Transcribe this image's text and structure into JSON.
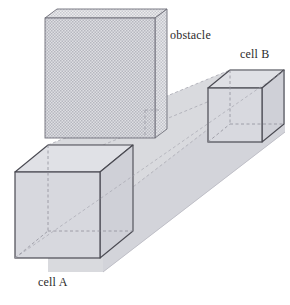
{
  "figure": {
    "type": "3d-line-diagram",
    "width": 290,
    "height": 305,
    "background_color": "#ffffff"
  },
  "labels": {
    "obstacle": "obstacle",
    "cell_b": "cell B",
    "cell_a": "cell A"
  },
  "colors": {
    "stroke_solid": "#4a4a52",
    "stroke_hidden": "#8f8f99",
    "beam_fill": "#d8d9de",
    "beam_fill_top": "#e4e5ea",
    "beam_fill_side": "#cfd0d6",
    "cell_fill": "#d2d3d9",
    "obstacle_fill": "#d6d7dc",
    "obstacle_hatch": "#9a9aa4",
    "obstacle_edge": "#6e6e78",
    "label_color": "#2b2b2b"
  },
  "geometry": {
    "obstacle": {
      "name": "obstacle",
      "kind": "slab",
      "face_front": [
        [
          45,
          18
        ],
        [
          155,
          18
        ],
        [
          155,
          138
        ],
        [
          45,
          138
        ]
      ],
      "top_offset": [
        12,
        -10
      ],
      "hatched": true
    },
    "cell_a": {
      "name": "cell A",
      "kind": "wireframe-cube",
      "front_face": [
        [
          15,
          172
        ],
        [
          100,
          172
        ],
        [
          100,
          258
        ],
        [
          15,
          258
        ]
      ],
      "depth_offset": [
        33,
        -27
      ]
    },
    "cell_b": {
      "name": "cell B",
      "kind": "wireframe-cube",
      "front_face": [
        [
          208,
          88
        ],
        [
          262,
          88
        ],
        [
          262,
          142
        ],
        [
          208,
          142
        ]
      ],
      "depth_offset": [
        22,
        -18
      ]
    },
    "beam": {
      "name": "corridor-beam",
      "kind": "swept-prism",
      "from": "cell A",
      "to": "cell B",
      "shaded": true
    }
  }
}
